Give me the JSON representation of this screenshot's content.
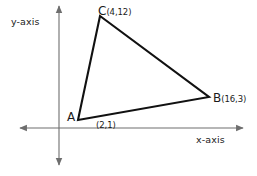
{
  "figure": {
    "background_color": "#ffffff",
    "axis_color": "#6e6e6e",
    "shape_color": "#111111",
    "text_color": "#1a1a1a",
    "axes": {
      "y_label": "y-axis",
      "x_label": "x-axis",
      "origin_px": [
        59,
        128
      ],
      "x_left_px": 18,
      "x_right_px": 245,
      "y_top_px": 3,
      "y_bottom_px": 168
    },
    "shape": {
      "type": "triangle",
      "vertices": [
        {
          "letter": "A",
          "coord": "(2,1)",
          "x": 2,
          "y": 1,
          "px": [
            78,
            120
          ]
        },
        {
          "letter": "B",
          "coord": "(16,3)",
          "x": 16,
          "y": 3,
          "px": [
            209,
            97
          ]
        },
        {
          "letter": "C",
          "coord": "(4,12)",
          "x": 4,
          "y": 12,
          "px": [
            100,
            16
          ]
        }
      ],
      "path": "M 78,120 L 100,16 L 209,97 Z"
    }
  }
}
